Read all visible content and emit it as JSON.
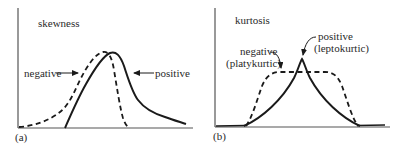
{
  "panels": [
    {
      "id": "a",
      "title": "skewness",
      "panel_label": "(a)",
      "labels": {
        "negative": "negative",
        "positive": "positive"
      }
    },
    {
      "id": "b",
      "title": "kurtosis",
      "panel_label": "(b)",
      "labels": {
        "negative_line1": "negative",
        "negative_line2": "(platykurtic)",
        "positive_line1": "positive",
        "positive_line2": "(leptokurtic)"
      }
    }
  ],
  "colors": {
    "curve": "#1a1a1a",
    "axis": "#555555",
    "text": "#2a2a2a",
    "background": "#ffffff"
  }
}
